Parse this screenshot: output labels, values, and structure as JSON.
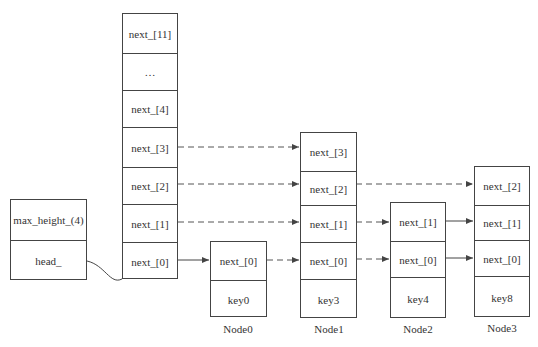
{
  "meta_box": {
    "cells": [
      "max_height_(4)",
      "head_"
    ]
  },
  "head_node": {
    "cells": [
      "next_[11]",
      "…",
      "next_[4]",
      "next_[3]",
      "next_[2]",
      "next_[1]",
      "next_[0]"
    ]
  },
  "nodes": [
    {
      "name": "Node0",
      "cells": [
        "next_[0]",
        "key0"
      ]
    },
    {
      "name": "Node1",
      "cells": [
        "next_[3]",
        "next_[2]",
        "next_[1]",
        "next_[0]",
        "key3"
      ]
    },
    {
      "name": "Node2",
      "cells": [
        "next_[1]",
        "next_[0]",
        "key4"
      ]
    },
    {
      "name": "Node3",
      "cells": [
        "next_[2]",
        "next_[1]",
        "next_[0]",
        "key8"
      ]
    }
  ]
}
